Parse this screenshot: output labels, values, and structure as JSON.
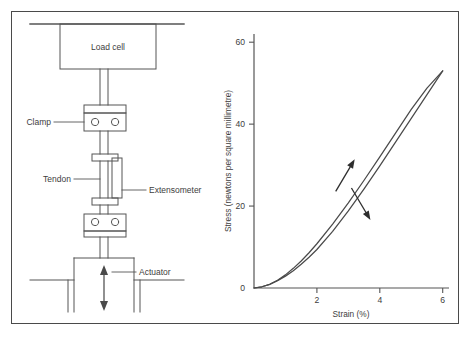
{
  "figure": {
    "background_color": "#ffffff",
    "border_color": "#4a4a4a",
    "line_color": "#555555",
    "text_color": "#3d3d3d"
  },
  "apparatus": {
    "title": "tensile testing rig schematic",
    "labels": {
      "load_cell": "Load cell",
      "clamp": "Clamp",
      "tendon": "Tendon",
      "extensometer": "Extensometer",
      "actuator": "Actuator"
    }
  },
  "chart_data": {
    "type": "line",
    "title": "",
    "xlabel": "Strain (%)",
    "ylabel": "Stress (newtons per square millimetre)",
    "xlim": [
      0,
      6.2
    ],
    "ylim": [
      0,
      62
    ],
    "xticks": [
      2,
      4,
      6
    ],
    "xtick_labels": [
      "2",
      "4",
      "6"
    ],
    "yticks": [
      0,
      20,
      40,
      60
    ],
    "ytick_labels": [
      "0",
      "20",
      "40",
      "60"
    ],
    "grid": false,
    "legend": "none",
    "series": [
      {
        "name": "loading",
        "direction": "up",
        "points": [
          [
            0.0,
            0.0
          ],
          [
            0.25,
            0.3
          ],
          [
            0.5,
            0.9
          ],
          [
            0.75,
            1.9
          ],
          [
            1.0,
            3.2
          ],
          [
            1.25,
            4.8
          ],
          [
            1.5,
            6.6
          ],
          [
            1.75,
            8.6
          ],
          [
            2.0,
            10.8
          ],
          [
            2.5,
            15.6
          ],
          [
            3.0,
            20.8
          ],
          [
            3.5,
            26.3
          ],
          [
            4.0,
            32.0
          ],
          [
            4.5,
            37.8
          ],
          [
            5.0,
            43.6
          ],
          [
            5.5,
            48.8
          ],
          [
            6.0,
            53.0
          ]
        ]
      },
      {
        "name": "unloading",
        "direction": "down",
        "points": [
          [
            6.0,
            53.0
          ],
          [
            5.5,
            47.2
          ],
          [
            5.0,
            41.4
          ],
          [
            4.5,
            35.6
          ],
          [
            4.0,
            29.8
          ],
          [
            3.5,
            24.2
          ],
          [
            3.0,
            18.8
          ],
          [
            2.5,
            13.8
          ],
          [
            2.0,
            9.4
          ],
          [
            1.75,
            7.5
          ],
          [
            1.5,
            5.8
          ],
          [
            1.25,
            4.2
          ],
          [
            1.0,
            2.9
          ],
          [
            0.75,
            1.8
          ],
          [
            0.5,
            0.9
          ],
          [
            0.25,
            0.3
          ],
          [
            0.0,
            0.0
          ]
        ]
      }
    ],
    "annotations": [
      {
        "name": "loading-arrow",
        "symbol": "arrow-up",
        "x": 2.9,
        "y": 27.5
      },
      {
        "name": "unloading-arrow",
        "symbol": "arrow-down",
        "x": 3.4,
        "y": 20.5
      }
    ]
  }
}
